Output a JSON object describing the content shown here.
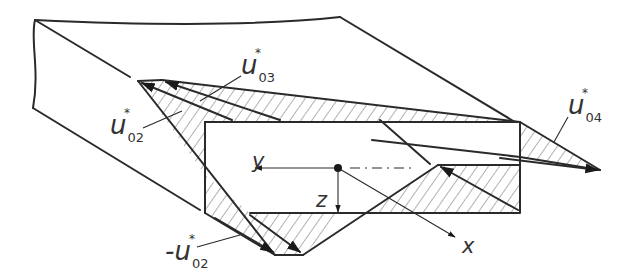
{
  "figure": {
    "type": "isometric-beam-warping-diagram",
    "labels": {
      "u03": {
        "prefix": "",
        "symbol": "u",
        "star": "*",
        "subscript": "03"
      },
      "u02": {
        "prefix": "",
        "symbol": "u",
        "star": "*",
        "subscript": "02"
      },
      "neg_u02": {
        "prefix": "-",
        "symbol": "u",
        "star": "*",
        "subscript": "02"
      },
      "u04": {
        "prefix": "",
        "symbol": "u",
        "star": "*",
        "subscript": "04"
      }
    },
    "axes": {
      "y": "y",
      "z": "z",
      "x": "x"
    },
    "colors": {
      "line": "#2a2a2a",
      "hatch": "#555555",
      "background": "#ffffff"
    }
  }
}
